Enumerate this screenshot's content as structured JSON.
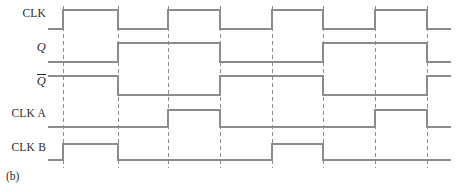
{
  "figure": {
    "caption": "(b)",
    "type": "digital-timing-diagram",
    "stroke_color": "#8c8c8c",
    "dash_color": "#8c8c8c",
    "text_color": "#2b2b2b",
    "background_color": "#ffffff",
    "width": 457,
    "height": 192
  },
  "labels": {
    "clk": "CLK",
    "q": "Q",
    "qbar": "Q",
    "clk_a": "CLK A",
    "clk_b": "CLK B"
  },
  "chart_data": {
    "type": "line",
    "title": "(b)",
    "xlabel": "",
    "ylabel": "",
    "grid": true,
    "legend_position": "left",
    "x_axis": {
      "domain_px": [
        48,
        457
      ],
      "waveform_start_px": 48,
      "waveform_end_px": 451
    },
    "gridlines_px": [
      63,
      118,
      168,
      220,
      272,
      323,
      375,
      427
    ],
    "rows": [
      {
        "name": "CLK",
        "label": "CLK",
        "label_x": 46,
        "label_y": 14,
        "high_y": 10,
        "low_y": 29,
        "initial_level": 0,
        "transitions_px": [
          63,
          118,
          168,
          220,
          272,
          323,
          375,
          427
        ],
        "levels": [
          0,
          1,
          0,
          1,
          0,
          1,
          0,
          1,
          0
        ]
      },
      {
        "name": "Q",
        "label": "Q",
        "label_x": 46,
        "label_y": 47,
        "high_y": 43,
        "low_y": 62,
        "initial_level": 0,
        "transitions_px": [
          118,
          220,
          323,
          427
        ],
        "levels": [
          0,
          1,
          0,
          1,
          0
        ]
      },
      {
        "name": "Qbar",
        "label": "Q",
        "label_x": 46,
        "label_y": 80,
        "high_y": 76,
        "low_y": 95,
        "initial_level": 1,
        "transitions_px": [
          118,
          220,
          323,
          427
        ],
        "levels": [
          1,
          0,
          1,
          0,
          1
        ]
      },
      {
        "name": "CLK A",
        "label": "CLK A",
        "label_x": 46,
        "label_y": 114,
        "high_y": 110,
        "low_y": 127,
        "initial_level": 0,
        "transitions_px": [
          168,
          220,
          375,
          427
        ],
        "levels": [
          0,
          1,
          0,
          1,
          0
        ]
      },
      {
        "name": "CLK B",
        "label": "CLK B",
        "label_x": 46,
        "label_y": 148,
        "high_y": 144,
        "low_y": 160,
        "initial_level": 0,
        "transitions_px": [
          63,
          118,
          272,
          323
        ],
        "levels": [
          0,
          1,
          0,
          1,
          0
        ]
      }
    ]
  }
}
